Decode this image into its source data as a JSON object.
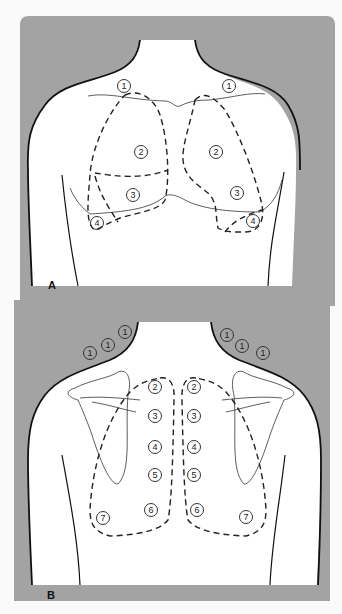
{
  "figure": {
    "panel_a": {
      "letter": "A",
      "view": "anterior chest",
      "labels": [
        {
          "text": "1",
          "x": 124,
          "y": 86
        },
        {
          "text": "1",
          "x": 229,
          "y": 86
        },
        {
          "text": "2",
          "x": 141,
          "y": 152
        },
        {
          "text": "2",
          "x": 216,
          "y": 152
        },
        {
          "text": "3",
          "x": 133,
          "y": 195
        },
        {
          "text": "3",
          "x": 237,
          "y": 193
        },
        {
          "text": "4",
          "x": 97,
          "y": 223
        },
        {
          "text": "4",
          "x": 253,
          "y": 221
        }
      ]
    },
    "panel_b": {
      "letter": "B",
      "view": "posterior chest",
      "labels": [
        {
          "text": "1",
          "x": 90,
          "y": 353
        },
        {
          "text": "1",
          "x": 108,
          "y": 345
        },
        {
          "text": "1",
          "x": 125,
          "y": 332
        },
        {
          "text": "1",
          "x": 227,
          "y": 335
        },
        {
          "text": "1",
          "x": 242,
          "y": 346
        },
        {
          "text": "1",
          "x": 263,
          "y": 353
        },
        {
          "text": "2",
          "x": 155,
          "y": 387
        },
        {
          "text": "2",
          "x": 194,
          "y": 387
        },
        {
          "text": "3",
          "x": 155,
          "y": 416
        },
        {
          "text": "3",
          "x": 194,
          "y": 416
        },
        {
          "text": "4",
          "x": 155,
          "y": 447
        },
        {
          "text": "4",
          "x": 194,
          "y": 447
        },
        {
          "text": "5",
          "x": 155,
          "y": 475
        },
        {
          "text": "5",
          "x": 194,
          "y": 475
        },
        {
          "text": "6",
          "x": 151,
          "y": 510
        },
        {
          "text": "6",
          "x": 197,
          "y": 510
        },
        {
          "text": "7",
          "x": 103,
          "y": 518
        },
        {
          "text": "7",
          "x": 246,
          "y": 517
        }
      ]
    }
  }
}
